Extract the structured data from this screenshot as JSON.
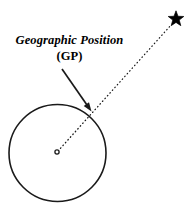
{
  "figure": {
    "canvas": {
      "width": 195,
      "height": 214,
      "background": "#FFFFFF"
    },
    "stroke_color": "#1A1A1A",
    "annotation": {
      "line1": "Geographic Position",
      "line2": "(GP)"
    },
    "elements": {
      "earth_circle": {
        "name": "earth-circle",
        "center_x": 57.5,
        "center_y": 153,
        "radius": 48.5,
        "stroke_width": 1.6,
        "fill": "none"
      },
      "earth_center_dot": {
        "name": "earth-center-dot",
        "center_x": 57,
        "center_y": 152,
        "radius": 2.1,
        "stroke_width": 1.3,
        "fill": "none"
      },
      "star": {
        "name": "celestial-body-star",
        "center_x": 176,
        "center_y": 19,
        "outer_radius": 8.2,
        "inner_radius": 3.4,
        "points": 5,
        "fill": "#000000"
      },
      "sight_line": {
        "name": "line-of-sight-dotted",
        "x1": 58,
        "y1": 151,
        "x2": 171,
        "y2": 25,
        "stroke_width": 1.25,
        "dash": "0.6 3.1"
      },
      "leader_arrow": {
        "name": "gp-leader-arrow",
        "x1": 62,
        "y1": 69,
        "x2": 91.5,
        "y2": 111.5,
        "stroke_width": 1.7,
        "head_length": 9,
        "head_width": 6.4
      }
    }
  }
}
